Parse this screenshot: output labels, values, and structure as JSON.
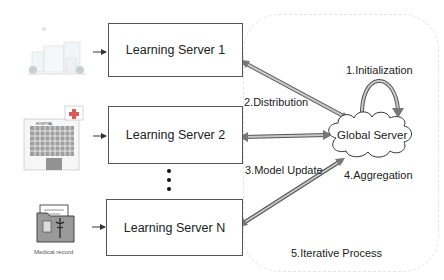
{
  "servers": [
    {
      "label": "Learning Server 1"
    },
    {
      "label": "Learning Server 2"
    },
    {
      "label": "Learning Server N"
    }
  ],
  "clients": [
    {
      "icon": "clinic-building-icon"
    },
    {
      "icon": "hospital-building-icon",
      "sign": "HOSPITAL"
    },
    {
      "icon": "medical-record-folder-icon",
      "caption": "Medical record"
    }
  ],
  "global_server": {
    "label": "Global Server"
  },
  "steps": {
    "initialization": "1.Initialization",
    "distribution": "2.Distribution",
    "model_update": "3.Model Update",
    "aggregation": "4.Aggregation",
    "iterative": "5.Iterative Process"
  },
  "ellipsis": "⋮",
  "colors": {
    "box_border": "#555555",
    "arrow_fill": "#bdbdbd",
    "arrow_stroke": "#555555",
    "region_border": "#e4e4e4"
  }
}
